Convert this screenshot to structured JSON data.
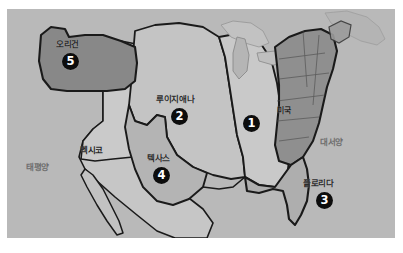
{
  "figure": {
    "kind": "historical-map-photograph",
    "background_color": "#ffffff",
    "plate_color": "#b9b9b9"
  },
  "palette": {
    "paper_white": "#ffffff",
    "sea_gray": "#b9b9b9",
    "land_light": "#c9c9c9",
    "land_mid": "#b0b0b0",
    "land_dark": "#8f8f8f",
    "land_darkest": "#7a7a7a",
    "outline_black": "#1a1a1a",
    "outline_thin": "#5a5a5a",
    "marker_fill": "#0d0d0d",
    "marker_text": "#ffffff",
    "label_text": "#2b2b2b",
    "ocean_text": "#6f6f6f"
  },
  "map": {
    "oceans": [
      {
        "id": "pacific",
        "label": "태평양",
        "x": 26,
        "y": 163
      },
      {
        "id": "atlantic",
        "label": "대서양",
        "x": 320,
        "y": 138
      }
    ],
    "countries": [
      {
        "id": "mexico",
        "label": "멕시코",
        "x": 80,
        "y": 146
      },
      {
        "id": "usa",
        "label": "미국",
        "x": 277,
        "y": 107
      }
    ],
    "regions": [
      {
        "id": "original-states",
        "number": "1",
        "label": "",
        "shade": "#c9c9c9",
        "marker_x": 243,
        "marker_y": 115
      },
      {
        "id": "louisiana",
        "number": "2",
        "label": "루이지애나",
        "shade": "#c4c4c4",
        "label_x": 156,
        "label_y": 95,
        "marker_x": 171,
        "marker_y": 108
      },
      {
        "id": "florida",
        "number": "3",
        "label": "플로리다",
        "shade": "#b0b0b0",
        "label_x": 303,
        "label_y": 179,
        "marker_x": 316,
        "marker_y": 192
      },
      {
        "id": "texas",
        "number": "4",
        "label": "텍사스",
        "shade": "#b6b6b6",
        "label_x": 147,
        "label_y": 154,
        "marker_x": 153,
        "marker_y": 167
      },
      {
        "id": "oregon",
        "number": "5",
        "label": "오리건",
        "shade": "#8a8a8a",
        "label_x": 56,
        "label_y": 40,
        "marker_x": 62,
        "marker_y": 53
      }
    ],
    "legend_numbers": [
      "1",
      "2",
      "3",
      "4",
      "5"
    ]
  }
}
